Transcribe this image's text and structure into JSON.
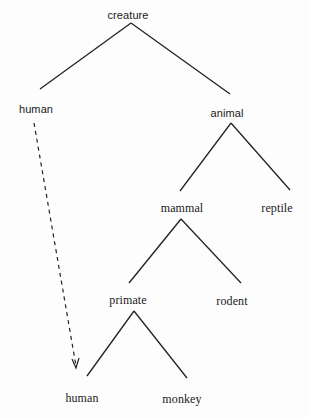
{
  "diagram": {
    "type": "taxonomy-tree",
    "nodes": {
      "creature": {
        "label": "creature"
      },
      "human_top": {
        "label": "human"
      },
      "animal": {
        "label": "animal"
      },
      "mammal": {
        "label": "mammal"
      },
      "reptile": {
        "label": "reptile"
      },
      "primate": {
        "label": "primate"
      },
      "rodent": {
        "label": "rodent"
      },
      "human_bottom": {
        "label": "human"
      },
      "monkey": {
        "label": "monkey"
      }
    },
    "edges": [
      {
        "from": "creature",
        "to": "human_top",
        "style": "solid"
      },
      {
        "from": "creature",
        "to": "animal",
        "style": "solid"
      },
      {
        "from": "animal",
        "to": "mammal",
        "style": "solid"
      },
      {
        "from": "animal",
        "to": "reptile",
        "style": "solid"
      },
      {
        "from": "mammal",
        "to": "primate",
        "style": "solid"
      },
      {
        "from": "mammal",
        "to": "rodent",
        "style": "solid"
      },
      {
        "from": "primate",
        "to": "human_bottom",
        "style": "solid"
      },
      {
        "from": "primate",
        "to": "monkey",
        "style": "solid"
      },
      {
        "from": "human_top",
        "to": "human_bottom",
        "style": "dashed-arrow"
      }
    ],
    "colors": {
      "line": "#222222",
      "text": "#1a1a1a",
      "background": "#fdfdfd"
    }
  }
}
